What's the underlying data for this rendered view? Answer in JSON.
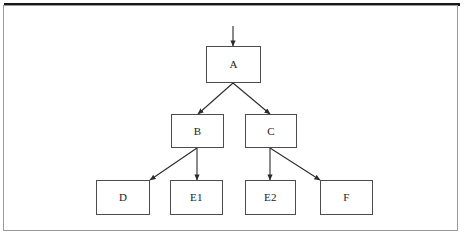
{
  "figure": {
    "type": "tree-diagram",
    "caption": "",
    "frame": {
      "border_color": "#9a9a9a",
      "top_rule_color": "#181818"
    },
    "background_color": "#ffffff",
    "box_border_color": "#4c4c4c",
    "arrow_color": "#2b2b2b",
    "text_color": "#1b1b1b"
  },
  "nodes": [
    {
      "id": "A",
      "label": "A",
      "x": 206,
      "y": 46,
      "w": 55,
      "h": 37,
      "level": 0
    },
    {
      "id": "B",
      "label": "B",
      "x": 171,
      "y": 114,
      "w": 53,
      "h": 34,
      "level": 1
    },
    {
      "id": "C",
      "label": "C",
      "x": 245,
      "y": 114,
      "w": 52,
      "h": 34,
      "level": 1
    },
    {
      "id": "D",
      "label": "D",
      "x": 96,
      "y": 180,
      "w": 54,
      "h": 35,
      "level": 2
    },
    {
      "id": "E1",
      "label": "E1",
      "x": 170,
      "y": 180,
      "w": 53,
      "h": 35,
      "level": 2
    },
    {
      "id": "E2",
      "label": "E2",
      "x": 245,
      "y": 180,
      "w": 51,
      "h": 35,
      "level": 2
    },
    {
      "id": "F",
      "label": "F",
      "x": 320,
      "y": 180,
      "w": 53,
      "h": 35,
      "level": 2
    }
  ],
  "edges": [
    {
      "from": "entry",
      "to": "A",
      "x1": 233,
      "y1": 26,
      "x2": 233,
      "y2": 46,
      "kind": "vertical"
    },
    {
      "from": "A",
      "to": "B",
      "x1": 233,
      "y1": 83,
      "x2": 198,
      "y2": 114,
      "kind": "diagonal"
    },
    {
      "from": "A",
      "to": "C",
      "x1": 233,
      "y1": 83,
      "x2": 270,
      "y2": 114,
      "kind": "diagonal"
    },
    {
      "from": "B",
      "to": "D",
      "x1": 197,
      "y1": 148,
      "x2": 150,
      "y2": 180,
      "kind": "diagonal"
    },
    {
      "from": "B",
      "to": "E1",
      "x1": 197,
      "y1": 148,
      "x2": 197,
      "y2": 180,
      "kind": "vertical"
    },
    {
      "from": "C",
      "to": "E2",
      "x1": 270,
      "y1": 148,
      "x2": 270,
      "y2": 180,
      "kind": "vertical"
    },
    {
      "from": "C",
      "to": "F",
      "x1": 270,
      "y1": 148,
      "x2": 320,
      "y2": 180,
      "kind": "diagonal"
    }
  ]
}
